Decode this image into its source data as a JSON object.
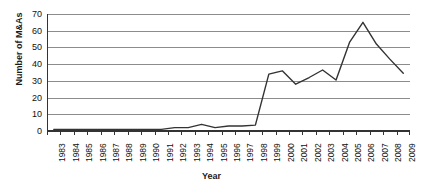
{
  "chart_data": {
    "type": "line",
    "title": "",
    "subtitle": "",
    "xlabel": "Year",
    "ylabel": "Number of M&As",
    "categories": [
      "1983",
      "1984",
      "1985",
      "1986",
      "1987",
      "1988",
      "1989",
      "1990",
      "1991",
      "1992",
      "1993",
      "1994",
      "1995",
      "1996",
      "1997",
      "1998",
      "1999",
      "2000",
      "2001",
      "2002",
      "2003",
      "2004",
      "2005",
      "2006",
      "2007",
      "2008",
      "2009"
    ],
    "values": [
      1,
      1,
      1,
      1,
      1,
      1,
      1,
      1,
      1,
      2,
      2,
      4,
      2,
      3,
      3,
      3.5,
      34,
      36,
      28,
      32,
      36.5,
      30.5,
      53,
      65,
      52,
      43,
      34.5
    ],
    "series": [
      {
        "name": "Number of M&As",
        "color": "#333333",
        "values": [
          1,
          1,
          1,
          1,
          1,
          1,
          1,
          1,
          1,
          2,
          2,
          4,
          2,
          3,
          3,
          3.5,
          34,
          36,
          28,
          32,
          36.5,
          30.5,
          53,
          65,
          52,
          43,
          34.5
        ]
      }
    ],
    "ylim": [
      0,
      70
    ],
    "yticks": [
      0,
      10,
      20,
      30,
      40,
      50,
      60,
      70
    ],
    "ytick_labels": [
      "0",
      "10",
      "20",
      "30",
      "40",
      "50",
      "60",
      "70"
    ],
    "grid": "horizontal",
    "legend": "none",
    "annotations": []
  }
}
